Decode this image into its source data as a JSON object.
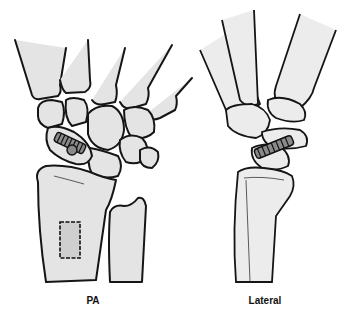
{
  "figure": {
    "views": [
      {
        "id": "pa",
        "label": "PA"
      },
      {
        "id": "lateral",
        "label": "Lateral"
      }
    ],
    "elements": {
      "pa": [
        "metacarpals",
        "carpal bones",
        "scaphoid with screw",
        "radius",
        "ulna",
        "bone graft donor site"
      ],
      "lateral": [
        "metacarpals",
        "carpal bones",
        "scaphoid with screw",
        "radius"
      ]
    },
    "colors": {
      "bone_fill": "#e4e4e4",
      "outline": "#151515",
      "screw": "#8a8a8a",
      "background": "#ffffff"
    }
  }
}
